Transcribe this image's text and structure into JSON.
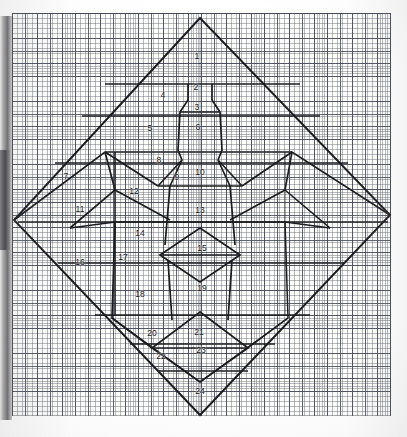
{
  "document": {
    "title": "Graph Paper Pattern Diagram",
    "medium": "graph paper",
    "description": "Hand-drawn diamond layout with a centered stylized figure divided into 24 numbered regions"
  },
  "colors": {
    "paper": "#fdfdfb",
    "grid_fine": "#5a5f69",
    "grid_heavy": "#373c48",
    "ink": "#1b1b20",
    "label_text": "#15151a"
  },
  "grid": {
    "fine_cell_px": 2.52,
    "heavy_cell_px": 12.6,
    "fine_per_heavy": 5
  },
  "frame": {
    "diamond_label": "outer-diamond",
    "top_vertex": "200,18",
    "right_vertex": "390,215",
    "bottom_vertex": "200,415",
    "left_vertex": "14,220"
  },
  "regions": [
    {
      "id": 1,
      "label": "1",
      "x": 197,
      "y": 56,
      "name": "region-1-head-top"
    },
    {
      "id": 2,
      "label": "2",
      "x": 196,
      "y": 87,
      "name": "region-2-neck"
    },
    {
      "id": 3,
      "label": "3",
      "x": 197,
      "y": 107,
      "name": "region-3-collar"
    },
    {
      "id": 4,
      "label": "4",
      "x": 163,
      "y": 95,
      "name": "region-4-upper-left-panel"
    },
    {
      "id": 5,
      "label": "5",
      "x": 150,
      "y": 128,
      "name": "region-5-left-panel"
    },
    {
      "id": 6,
      "label": "6",
      "x": 198,
      "y": 127,
      "name": "region-6-chest"
    },
    {
      "id": 7,
      "label": "7",
      "x": 66,
      "y": 176,
      "name": "region-7-left-wing-outer"
    },
    {
      "id": 8,
      "label": "8",
      "x": 159,
      "y": 160,
      "name": "region-8-left-shoulder"
    },
    {
      "id": 9,
      "label": "9",
      "x": 177,
      "y": 177,
      "name": "region-9-left-armpit"
    },
    {
      "id": 10,
      "label": "10",
      "x": 200,
      "y": 172,
      "name": "region-10-upper-torso"
    },
    {
      "id": 11,
      "label": "11",
      "x": 80,
      "y": 209,
      "name": "region-11-left-wing-inner"
    },
    {
      "id": 12,
      "label": "12",
      "x": 134,
      "y": 191,
      "name": "region-12-left-sleeve"
    },
    {
      "id": 13,
      "label": "13",
      "x": 200,
      "y": 210,
      "name": "region-13-torso"
    },
    {
      "id": 14,
      "label": "14",
      "x": 140,
      "y": 233,
      "name": "region-14-left-cuff"
    },
    {
      "id": 15,
      "label": "15",
      "x": 202,
      "y": 248,
      "name": "region-15-waist"
    },
    {
      "id": 16,
      "label": "16",
      "x": 80,
      "y": 262,
      "name": "region-16-lower-left-outer"
    },
    {
      "id": 17,
      "label": "17",
      "x": 123,
      "y": 257,
      "name": "region-17-lower-left-inner"
    },
    {
      "id": 18,
      "label": "18",
      "x": 140,
      "y": 294,
      "name": "region-18-left-skirt"
    },
    {
      "id": 19,
      "label": "19",
      "x": 202,
      "y": 288,
      "name": "region-19-hips"
    },
    {
      "id": 20,
      "label": "20",
      "x": 152,
      "y": 333,
      "name": "region-20-lower-left-skirt"
    },
    {
      "id": 21,
      "label": "21",
      "x": 199,
      "y": 332,
      "name": "region-21-lower-center"
    },
    {
      "id": 22,
      "label": "22",
      "x": 161,
      "y": 356,
      "name": "region-22-lower-left-hem"
    },
    {
      "id": 23,
      "label": "23",
      "x": 201,
      "y": 350,
      "name": "region-23-lower-point"
    },
    {
      "id": 24,
      "label": "24",
      "x": 200,
      "y": 391,
      "name": "region-24-bottom-point"
    }
  ]
}
